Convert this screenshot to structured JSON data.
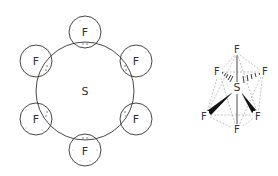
{
  "left_diagram": {
    "title": "SF6 electron-dot overlap diagram",
    "central_atom": "S",
    "ligands": [
      {
        "label": "F",
        "position": "top"
      },
      {
        "label": "F",
        "position": "upper-right"
      },
      {
        "label": "F",
        "position": "lower-right"
      },
      {
        "label": "F",
        "position": "bottom"
      },
      {
        "label": "F",
        "position": "lower-left"
      },
      {
        "label": "F",
        "position": "upper-left"
      }
    ]
  },
  "right_diagram": {
    "title": "SF6 octahedral structure",
    "central_atom": "S",
    "ligands": [
      {
        "label": "F",
        "position": "axial-top"
      },
      {
        "label": "F",
        "position": "back-left"
      },
      {
        "label": "F",
        "position": "back-right"
      },
      {
        "label": "F",
        "position": "front-left"
      },
      {
        "label": "F",
        "position": "front-right"
      },
      {
        "label": "F",
        "position": "axial-bottom"
      }
    ]
  },
  "colors": {
    "line": "#333333",
    "dashed": "#999999",
    "dots": "#bbbbbb"
  }
}
